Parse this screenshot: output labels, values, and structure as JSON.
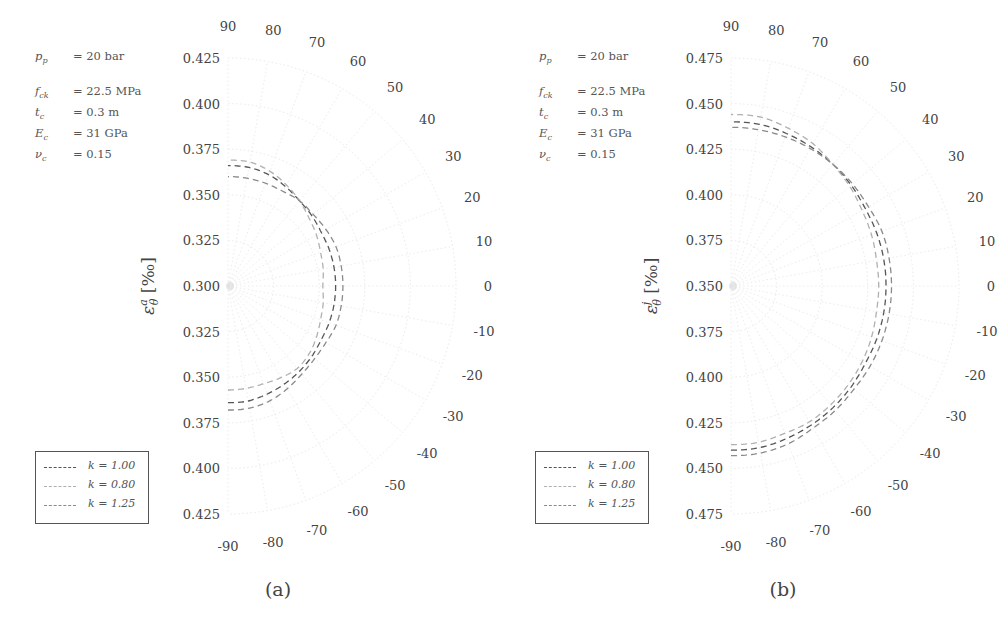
{
  "figure": {
    "panels": [
      {
        "id": "a",
        "caption": "(a)",
        "ylabel": "ε^a_θ [‰]",
        "ylabel_main": "ε",
        "ylabel_sup": "a",
        "ylabel_sub": "θ",
        "ylabel_unit": "[‰]",
        "params": [
          {
            "sym": "p_p",
            "sym_main": "p",
            "sym_sub": "p",
            "value": "= 20 bar"
          },
          {
            "sym": "f_ck",
            "sym_main": "f",
            "sym_sub": "ck",
            "value": "= 22.5 MPa"
          },
          {
            "sym": "t_c",
            "sym_main": "t",
            "sym_sub": "c",
            "value": "= 0.3 m"
          },
          {
            "sym": "E_c",
            "sym_main": "E",
            "sym_sub": "c",
            "value": "= 31 GPa"
          },
          {
            "sym": "ν_c",
            "sym_main": "ν",
            "sym_sub": "c",
            "value": "= 0.15"
          }
        ],
        "legend": [
          {
            "label": "k = 1.00",
            "color": "#555555"
          },
          {
            "label": "k = 0.80",
            "color": "#b0b0b0"
          },
          {
            "label": "k = 1.25",
            "color": "#8a8a8a"
          }
        ]
      },
      {
        "id": "b",
        "caption": "(b)",
        "ylabel": "ε^j_θ [‰]",
        "ylabel_main": "ε",
        "ylabel_sup": "j",
        "ylabel_sub": "θ",
        "ylabel_unit": "[‰]",
        "params": [
          {
            "sym": "p_p",
            "sym_main": "p",
            "sym_sub": "p",
            "value": "= 20 bar"
          },
          {
            "sym": "f_ck",
            "sym_main": "f",
            "sym_sub": "ck",
            "value": "= 22.5 MPa"
          },
          {
            "sym": "t_c",
            "sym_main": "t",
            "sym_sub": "c",
            "value": "= 0.3 m"
          },
          {
            "sym": "E_c",
            "sym_main": "E",
            "sym_sub": "c",
            "value": "= 31 GPa"
          },
          {
            "sym": "ν_c",
            "sym_main": "ν",
            "sym_sub": "c",
            "value": "= 0.15"
          }
        ],
        "legend": [
          {
            "label": "k = 1.00",
            "color": "#555555"
          },
          {
            "label": "k = 0.80",
            "color": "#b0b0b0"
          },
          {
            "label": "k = 1.25",
            "color": "#8a8a8a"
          }
        ]
      }
    ]
  },
  "chart_data": [
    {
      "type": "line",
      "subtype": "polar",
      "title": "(a)",
      "xlabel": "θ [deg]",
      "ylabel": "ε^a_θ [‰]",
      "theta_ticks": [
        90,
        80,
        70,
        60,
        50,
        40,
        30,
        20,
        10,
        0,
        -10,
        -20,
        -30,
        -40,
        -50,
        -60,
        -70,
        -80,
        -90
      ],
      "radial_ticks": [
        "0.425",
        "0.400",
        "0.375",
        "0.350",
        "0.325",
        "0.300",
        "0.325",
        "0.350",
        "0.375",
        "0.400",
        "0.425"
      ],
      "rlim": [
        0.3,
        0.425
      ],
      "theta_range": [
        -90,
        90
      ],
      "grid": true,
      "legend_position": "lower left",
      "x": [
        -90,
        -80,
        -70,
        -60,
        -50,
        -40,
        -30,
        -20,
        -10,
        0,
        10,
        20,
        30,
        40,
        50,
        60,
        70,
        80,
        90
      ],
      "series": [
        {
          "name": "k = 1.00",
          "style": "dashed",
          "color": "#555555",
          "values": [
            0.364,
            0.364,
            0.363,
            0.362,
            0.361,
            0.36,
            0.359,
            0.359,
            0.359,
            0.359,
            0.359,
            0.359,
            0.359,
            0.36,
            0.361,
            0.363,
            0.365,
            0.366,
            0.366
          ]
        },
        {
          "name": "k = 0.80",
          "style": "dashed",
          "color": "#b0b0b0",
          "values": [
            0.357,
            0.357,
            0.357,
            0.358,
            0.359,
            0.358,
            0.356,
            0.354,
            0.353,
            0.352,
            0.353,
            0.354,
            0.356,
            0.358,
            0.361,
            0.364,
            0.367,
            0.369,
            0.369
          ]
        },
        {
          "name": "k = 1.25",
          "style": "dashed",
          "color": "#8a8a8a",
          "values": [
            0.368,
            0.368,
            0.367,
            0.365,
            0.363,
            0.362,
            0.362,
            0.363,
            0.363,
            0.363,
            0.363,
            0.363,
            0.362,
            0.361,
            0.361,
            0.36,
            0.36,
            0.36,
            0.36
          ]
        }
      ]
    },
    {
      "type": "line",
      "subtype": "polar",
      "title": "(b)",
      "xlabel": "θ [deg]",
      "ylabel": "ε^j_θ [‰]",
      "theta_ticks": [
        90,
        80,
        70,
        60,
        50,
        40,
        30,
        20,
        10,
        0,
        -10,
        -20,
        -30,
        -40,
        -50,
        -60,
        -70,
        -80,
        -90
      ],
      "radial_ticks": [
        "0.475",
        "0.450",
        "0.425",
        "0.400",
        "0.375",
        "0.350",
        "0.375",
        "0.400",
        "0.425",
        "0.450",
        "0.475"
      ],
      "rlim": [
        0.35,
        0.475
      ],
      "theta_range": [
        -90,
        90
      ],
      "grid": true,
      "legend_position": "lower left",
      "x": [
        -90,
        -80,
        -70,
        -60,
        -50,
        -40,
        -30,
        -20,
        -10,
        0,
        10,
        20,
        30,
        40,
        50,
        60,
        70,
        80,
        90
      ],
      "series": [
        {
          "name": "k = 1.00",
          "style": "dashed",
          "color": "#555555",
          "values": [
            0.44,
            0.44,
            0.439,
            0.438,
            0.437,
            0.436,
            0.435,
            0.435,
            0.435,
            0.435,
            0.435,
            0.435,
            0.435,
            0.436,
            0.437,
            0.438,
            0.439,
            0.44,
            0.44
          ]
        },
        {
          "name": "k = 0.80",
          "style": "dashed",
          "color": "#b0b0b0",
          "values": [
            0.437,
            0.437,
            0.436,
            0.436,
            0.435,
            0.434,
            0.433,
            0.432,
            0.431,
            0.431,
            0.431,
            0.432,
            0.433,
            0.435,
            0.437,
            0.44,
            0.442,
            0.444,
            0.444
          ]
        },
        {
          "name": "k = 1.25",
          "style": "dashed",
          "color": "#8a8a8a",
          "values": [
            0.443,
            0.443,
            0.442,
            0.44,
            0.439,
            0.438,
            0.438,
            0.438,
            0.438,
            0.438,
            0.438,
            0.438,
            0.437,
            0.437,
            0.437,
            0.437,
            0.437,
            0.437,
            0.437
          ]
        }
      ]
    }
  ]
}
